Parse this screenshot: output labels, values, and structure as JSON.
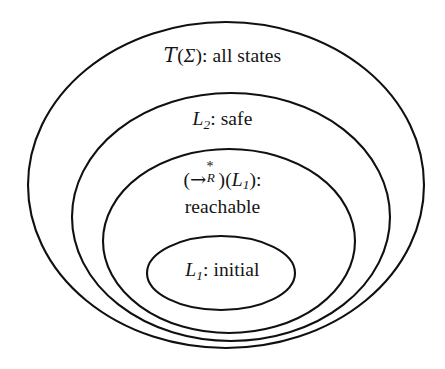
{
  "figure": {
    "kind": "nested-sets-diagram",
    "background_color": "#ffffff",
    "stroke_color": "#10100f"
  },
  "sets": [
    {
      "id": "all-states",
      "depth": 0,
      "label_lines": [
        "T(Σ): all states"
      ],
      "symbol": "𝒯(Σ)",
      "symbol_head": "T",
      "symbol_paren_open": "(",
      "symbol_arg": "Σ",
      "symbol_paren_close": ")",
      "separator": ":",
      "description": "all states",
      "ellipse": {
        "cx": 226,
        "cy": 185,
        "rx": 198,
        "ry": 163
      }
    },
    {
      "id": "safe",
      "depth": 1,
      "label_lines": [
        "L2: safe"
      ],
      "symbol_head": "L",
      "symbol_sub": "2",
      "separator": ":",
      "description": "safe",
      "ellipse": {
        "cx": 231,
        "cy": 217,
        "rx": 159,
        "ry": 124
      }
    },
    {
      "id": "reachable",
      "depth": 2,
      "label_lines": [
        "(→*R)(L1):",
        "reachable"
      ],
      "arrow_glyph": "→",
      "arrow_sup": "*",
      "arrow_sub": "R",
      "applied_to_head": "L",
      "applied_to_sub": "1",
      "separator": ":",
      "description": "reachable",
      "ellipse": {
        "cx": 229,
        "cy": 241,
        "rx": 126,
        "ry": 92
      }
    },
    {
      "id": "initial",
      "depth": 3,
      "label_lines": [
        "L1: initial"
      ],
      "symbol_head": "L",
      "symbol_sub": "1",
      "separator": ":",
      "description": "initial",
      "ellipse": {
        "cx": 221,
        "cy": 273,
        "rx": 74,
        "ry": 37
      }
    }
  ]
}
